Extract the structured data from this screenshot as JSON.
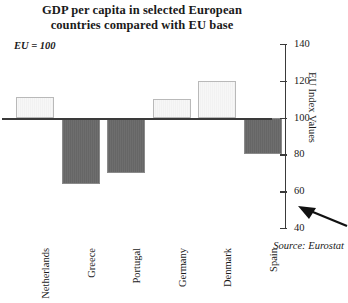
{
  "chart_data": {
    "type": "bar",
    "title": "GDP per capita in selected European countries compared with EU base",
    "title_line1": "GDP per capita in selected European",
    "title_line2": "countries compared with EU base",
    "subtitle": "EU = 100",
    "xlabel": "",
    "ylabel": "EU Index Values",
    "categories": [
      "Netherlands",
      "Greece",
      "Portugal",
      "Germany",
      "Denmark",
      "Spain"
    ],
    "values": [
      111,
      64,
      70,
      110,
      120,
      80
    ],
    "baseline": 100,
    "ylim": [
      40,
      140
    ],
    "yticks": [
      40,
      60,
      80,
      100,
      120,
      140
    ],
    "grid": false,
    "legend": false,
    "source": "Source: Eurostat",
    "colors": {
      "above_base_fill": "#f5f5f5",
      "above_base_border": "#b9b9b9",
      "below_base_fill": "#6a6a6a",
      "below_base_border": "#8a8a8a",
      "axis": "#3a3a3a",
      "text": "#1a1a1a"
    },
    "annotations": [
      {
        "name": "pointer-arrow",
        "direction": "left",
        "target": "y-axis lower range"
      }
    ]
  }
}
